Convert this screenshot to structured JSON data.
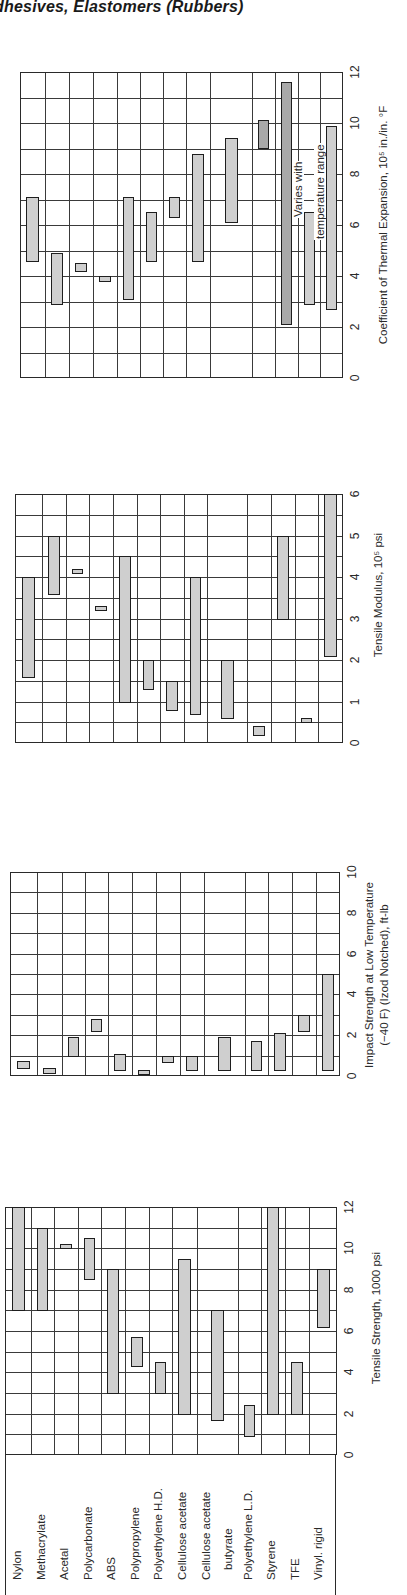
{
  "page": {
    "title": "dhesives, Elastomers (Rubbers)"
  },
  "materials": [
    "Nylon",
    "Methacrylate",
    "Acetal",
    "Polycarbonate",
    "ABS",
    "Polypropylene",
    "Polyethylene H.D.",
    "Cellulose acetate",
    "Cellulose acetate butyrate",
    "Polyethylene L.D.",
    "Styrene",
    "TFE",
    "Vinyl. rigid"
  ],
  "row_labels": {
    "nylon": "Nylon",
    "methacrylate": "Methacrylate",
    "acetal": "Acetal",
    "polycarbonate": "Polycarbonate",
    "abs": "ABS",
    "polypropylene": "Polypropylene",
    "pe_hd": "Polyethylene H.D.",
    "cellulose_acetate": "Cellulose acetate",
    "cab_line1": "Cellulose acetate",
    "cab_line2": "butyrate",
    "pe_ld": "Polyethylene L.D.",
    "styrene": "Styrene",
    "tfe": "TFE",
    "vinyl_rigid": "Vinyl. rigid"
  },
  "chart_data": [
    {
      "type": "bar",
      "subtype": "floating-range",
      "orientation": "rotated-90-ccw",
      "title": "Coefficient of Thermal Expansion",
      "xlabel": "",
      "ylabel": "Coefficient of Thermal Expansion, 10⁵ in./in. °F",
      "ylim": [
        0,
        12
      ],
      "ticks": [
        "0",
        "2",
        "4",
        "6",
        "8",
        "10",
        "12"
      ],
      "grid": true,
      "annotation": [
        "Varies with",
        "temperature range"
      ],
      "categories": [
        "Nylon",
        "Methacrylate",
        "Acetal",
        "Polycarbonate",
        "ABS",
        "Polypropylene",
        "Polyethylene H.D.",
        "Cellulose acetate",
        "Cellulose acetate butyrate",
        "Polyethylene L.D.",
        "Styrene",
        "TFE",
        "Vinyl. rigid"
      ],
      "ranges": [
        [
          4.6,
          7.1
        ],
        [
          2.9,
          4.9
        ],
        [
          4.2,
          4.5
        ],
        [
          3.8,
          4.0
        ],
        [
          3.1,
          7.1
        ],
        [
          4.6,
          6.5
        ],
        [
          6.3,
          7.1
        ],
        [
          4.6,
          8.8
        ],
        [
          6.1,
          9.4
        ],
        [
          9.0,
          10.1
        ],
        [
          2.1,
          11.6
        ],
        [
          2.9,
          6.5
        ],
        [
          2.7,
          9.9
        ]
      ]
    },
    {
      "type": "bar",
      "subtype": "floating-range",
      "orientation": "rotated-90-ccw",
      "title": "Tensile Modulus",
      "xlabel": "",
      "ylabel": "Tensile Modulus, 10⁵ psi",
      "ylim": [
        0,
        6
      ],
      "ticks": [
        "0",
        "1",
        "2",
        "3",
        "4",
        "5",
        "6"
      ],
      "grid": true,
      "categories": [
        "Nylon",
        "Methacrylate",
        "Acetal",
        "Polycarbonate",
        "ABS",
        "Polypropylene",
        "Polyethylene H.D.",
        "Cellulose acetate",
        "Cellulose acetate butyrate",
        "Polyethylene L.D.",
        "Styrene",
        "TFE",
        "Vinyl. rigid"
      ],
      "ranges": [
        [
          1.6,
          4.0
        ],
        [
          3.6,
          5.0
        ],
        [
          4.1,
          4.2
        ],
        [
          3.2,
          3.3
        ],
        [
          1.0,
          4.5
        ],
        [
          1.3,
          2.0
        ],
        [
          0.8,
          1.5
        ],
        [
          0.7,
          4.0
        ],
        [
          0.6,
          2.0
        ],
        [
          0.2,
          0.4
        ],
        [
          3.0,
          5.0
        ],
        [
          0.5,
          0.6
        ],
        [
          2.1,
          6.0
        ]
      ]
    },
    {
      "type": "bar",
      "subtype": "floating-range",
      "orientation": "rotated-90-ccw",
      "title": "Impact Strength at Low Temperature",
      "xlabel": "",
      "ylabel": "Impact Strength at Low Temperature (−40 F) (Izod Notched), ft-lb",
      "ylim": [
        0,
        10
      ],
      "ticks": [
        "0",
        "2",
        "4",
        "6",
        "8",
        "10"
      ],
      "grid": true,
      "categories": [
        "Nylon",
        "Methacrylate",
        "Acetal",
        "Polycarbonate",
        "ABS",
        "Polypropylene",
        "Polyethylene H.D.",
        "Cellulose acetate",
        "Cellulose acetate butyrate",
        "Polyethylene L.D.",
        "Styrene",
        "TFE",
        "Vinyl. rigid"
      ],
      "ranges": [
        [
          0.4,
          0.75
        ],
        [
          0.15,
          0.4
        ],
        [
          1.0,
          1.9
        ],
        [
          2.2,
          2.8
        ],
        [
          0.3,
          1.1
        ],
        [
          0.1,
          0.3
        ],
        [
          0.7,
          1.0
        ],
        [
          0.3,
          1.0
        ],
        [
          0.3,
          1.9
        ],
        [
          0.3,
          1.7
        ],
        [
          0.3,
          2.1
        ],
        [
          2.2,
          3.0
        ],
        [
          0.3,
          5.0
        ]
      ]
    },
    {
      "type": "bar",
      "subtype": "floating-range",
      "orientation": "rotated-90-ccw",
      "title": "Tensile Strength",
      "xlabel": "",
      "ylabel": "Tensile Strength, 1000 psi",
      "ylim": [
        0,
        12
      ],
      "ticks": [
        "0",
        "2",
        "4",
        "6",
        "8",
        "10",
        "12"
      ],
      "grid": true,
      "categories": [
        "Nylon",
        "Methacrylate",
        "Acetal",
        "Polycarbonate",
        "ABS",
        "Polypropylene",
        "Polyethylene H.D.",
        "Cellulose acetate",
        "Cellulose acetate butyrate",
        "Polyethylene L.D.",
        "Styrene",
        "TFE",
        "Vinyl. rigid"
      ],
      "ranges": [
        [
          7.0,
          12.0
        ],
        [
          7.0,
          11.0
        ],
        [
          10.0,
          10.2
        ],
        [
          8.5,
          10.5
        ],
        [
          3.0,
          9.0
        ],
        [
          4.3,
          5.7
        ],
        [
          3.0,
          4.5
        ],
        [
          2.0,
          9.5
        ],
        [
          1.7,
          7.0
        ],
        [
          0.9,
          2.4
        ],
        [
          2.0,
          12.0
        ],
        [
          2.0,
          4.5
        ],
        [
          6.2,
          9.0
        ]
      ]
    }
  ],
  "axis_titles": {
    "thermal": "Coefficient of Thermal Expansion, 10⁵ in./in. °F",
    "modulus": "Tensile Modulus, 10⁵ psi",
    "impact_line1": "Impact Strength at Low Temperature",
    "impact_line2": "(−40 F) (Izod Notched), ft-lb",
    "tensile": "Tensile Strength, 1000 psi"
  },
  "annotation": {
    "line1": "Varies with",
    "line2": "temperature range"
  }
}
